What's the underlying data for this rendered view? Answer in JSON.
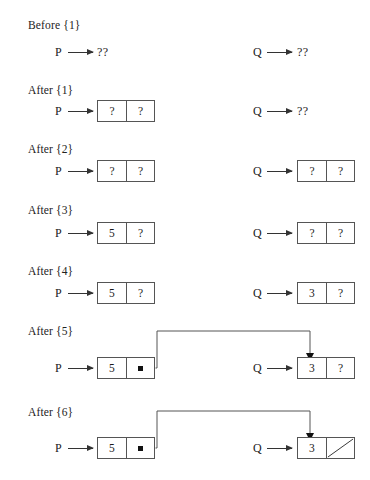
{
  "figure": {
    "title_visible": false,
    "background": "#ffffff",
    "line_color": "#555555",
    "text_color": "#1a1a1a"
  },
  "symbols": {
    "unknown_value": "?",
    "unknown_pointer": "??",
    "pointer_dot": "pointer-dot",
    "null_slash": "null-slash"
  },
  "steps": [
    {
      "label": "Before {1}",
      "left": {
        "pointer": "P",
        "target": "unknown",
        "unknown_text": "??"
      },
      "right": {
        "pointer": "Q",
        "target": "unknown",
        "unknown_text": "??"
      },
      "link": null
    },
    {
      "label": "After {1}",
      "left": {
        "pointer": "P",
        "target": "node",
        "cells": [
          "?",
          "?"
        ]
      },
      "right": {
        "pointer": "Q",
        "target": "unknown",
        "unknown_text": "??"
      },
      "link": null
    },
    {
      "label": "After {2}",
      "left": {
        "pointer": "P",
        "target": "node",
        "cells": [
          "?",
          "?"
        ]
      },
      "right": {
        "pointer": "Q",
        "target": "node",
        "cells": [
          "?",
          "?"
        ]
      },
      "link": null
    },
    {
      "label": "After {3}",
      "left": {
        "pointer": "P",
        "target": "node",
        "cells": [
          "5",
          "?"
        ]
      },
      "right": {
        "pointer": "Q",
        "target": "node",
        "cells": [
          "?",
          "?"
        ]
      },
      "link": null
    },
    {
      "label": "After {4}",
      "left": {
        "pointer": "P",
        "target": "node",
        "cells": [
          "5",
          "?"
        ]
      },
      "right": {
        "pointer": "Q",
        "target": "node",
        "cells": [
          "3",
          "?"
        ]
      },
      "link": null
    },
    {
      "label": "After {5}",
      "left": {
        "pointer": "P",
        "target": "node",
        "cells": [
          "5",
          "pointer-dot"
        ]
      },
      "right": {
        "pointer": "Q",
        "target": "node",
        "cells": [
          "3",
          "?"
        ]
      },
      "link": "p-next-to-q-node"
    },
    {
      "label": "After {6}",
      "left": {
        "pointer": "P",
        "target": "node",
        "cells": [
          "5",
          "pointer-dot"
        ]
      },
      "right": {
        "pointer": "Q",
        "target": "node",
        "cells": [
          "3",
          "null-slash"
        ]
      },
      "link": "p-next-to-q-node"
    }
  ]
}
